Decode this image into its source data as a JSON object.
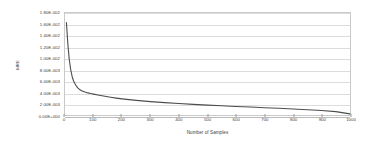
{
  "chart_data": {
    "type": "line",
    "title": "",
    "xlabel": "Number of Samples",
    "ylabel": "MRE",
    "xlim": [
      0,
      1000
    ],
    "ylim": [
      0,
      0.018
    ],
    "grid": "horizontal",
    "legend": "none",
    "line_color": "#4d4d4d",
    "xticks": [
      0,
      100,
      200,
      300,
      400,
      500,
      600,
      700,
      800,
      900,
      1000
    ],
    "xtick_labels": [
      "0",
      "100",
      "200",
      "300",
      "400",
      "500",
      "600",
      "700",
      "800",
      "900",
      "1000"
    ],
    "yticks": [
      0.0,
      0.002,
      0.004,
      0.006,
      0.008,
      0.01,
      0.012,
      0.014,
      0.016,
      0.018
    ],
    "ytick_labels": [
      "0.00E+000",
      "2.00E-003",
      "4.00E-003",
      "6.00E-003",
      "8.00E-003",
      "1.00E-002",
      "1.20E-002",
      "1.40E-002",
      "1.60E-002",
      "1.80E-002"
    ],
    "series": [
      {
        "name": "MRE",
        "x": [
          5,
          10,
          15,
          20,
          25,
          30,
          35,
          40,
          45,
          50,
          60,
          70,
          80,
          90,
          100,
          120,
          140,
          160,
          180,
          200,
          250,
          300,
          350,
          400,
          450,
          500,
          550,
          600,
          650,
          700,
          750,
          800,
          850,
          900,
          950,
          1000
        ],
        "values": [
          0.0163,
          0.0125,
          0.0098,
          0.008,
          0.0068,
          0.006,
          0.0055,
          0.0051,
          0.0048,
          0.00455,
          0.00425,
          0.00405,
          0.0039,
          0.00378,
          0.00368,
          0.00348,
          0.0033,
          0.00313,
          0.00298,
          0.00285,
          0.00258,
          0.00236,
          0.00218,
          0.00202,
          0.00188,
          0.00175,
          0.00163,
          0.00151,
          0.0014,
          0.00129,
          0.00118,
          0.00106,
          0.00094,
          0.00079,
          0.0006,
          0.0002
        ]
      }
    ]
  }
}
